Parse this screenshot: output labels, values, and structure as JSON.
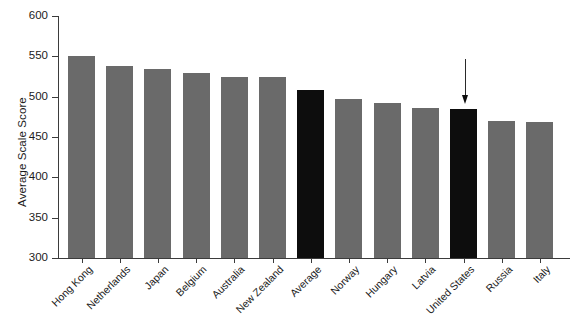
{
  "chart_data": {
    "type": "bar",
    "title": "",
    "xlabel": "",
    "ylabel": "Average Scale Score",
    "ylim": [
      300,
      600
    ],
    "yticks": [
      300,
      350,
      400,
      450,
      500,
      550,
      600
    ],
    "grid": false,
    "legend": null,
    "categories": [
      "Hong Kong",
      "Netherlands",
      "Japan",
      "Belgium",
      "Australia",
      "New Zealand",
      "Average",
      "Norway",
      "Hungary",
      "Latvia",
      "United States",
      "Russia",
      "Italy"
    ],
    "values": [
      550,
      538,
      534,
      529,
      524,
      524,
      508,
      497,
      492,
      486,
      485,
      470,
      468
    ],
    "bar_colors": [
      "#6a6a6a",
      "#6a6a6a",
      "#6a6a6a",
      "#6a6a6a",
      "#6a6a6a",
      "#6a6a6a",
      "#0d0d0d",
      "#6a6a6a",
      "#6a6a6a",
      "#6a6a6a",
      "#0d0d0d",
      "#6a6a6a",
      "#6a6a6a"
    ],
    "highlighted": [
      "Average",
      "United States"
    ],
    "annotations": [
      {
        "type": "arrow",
        "points_to": "United States",
        "direction": "down",
        "color": "#0d0d0d"
      }
    ]
  },
  "colors": {
    "bar_gray": "#6a6a6a",
    "bar_black": "#0d0d0d",
    "axis": "#3b3b3b",
    "text": "#1b1b1b",
    "background": "#ffffff"
  },
  "axis": {
    "y_title": "Average Scale Score",
    "y_tick_labels": [
      "600",
      "550",
      "500",
      "450",
      "400",
      "350",
      "300"
    ]
  }
}
